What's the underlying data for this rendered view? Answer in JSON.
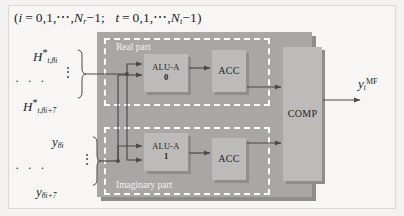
{
  "figure": {
    "domain_note": "hardware dataflow block diagram",
    "index_caption": {
      "full_text": "(i = 0,1,⋯, N_r −1;   t = 0,1,⋯, N_t −1)",
      "var_i": "i",
      "eq": "=",
      "seq_start": "0,1,",
      "ellipsis": "⋯",
      "bound_i_symbol": "N",
      "bound_i_sub": "r",
      "bound_i_tail": "−1;",
      "var_t": "t",
      "bound_t_symbol": "N",
      "bound_t_sub": "t",
      "bound_t_tail": "−1)",
      "open_paren": "(",
      "close_paren": ")"
    }
  },
  "inputs": {
    "h_first": {
      "base": "H",
      "star": "*",
      "sub": "t,8i"
    },
    "h_last": {
      "base": "H",
      "star": "*",
      "sub": "t,8i+7"
    },
    "y_first": {
      "base": "y",
      "sub": "8i"
    },
    "y_last": {
      "base": "y",
      "sub": "8i+7"
    },
    "horizontal_dots": "· · ·",
    "vertical_dots": "⋮"
  },
  "panels": [
    {
      "id": "real",
      "title": "Real part"
    },
    {
      "id": "imaginary",
      "title": "Imaginary part"
    }
  ],
  "units": {
    "alu0": {
      "label": "ALU-A",
      "index": "0"
    },
    "acc0": {
      "label": "ACC"
    },
    "alu1": {
      "label": "ALU-A",
      "index": "1"
    },
    "acc1": {
      "label": "ACC"
    },
    "comp": {
      "label": "COMP"
    }
  },
  "output": {
    "base": "y",
    "sub": "t",
    "sup": "MF"
  },
  "colors": {
    "background": "#f3f2f1",
    "main_panel": "#a9a7a5",
    "panel_shadow": "#8f8d8b",
    "unit_box": "#bdbbb9",
    "unit_shadow": "#908e8c",
    "dashed_border": "#fdfdfd",
    "wire": "#4a4a4a",
    "text": "#1f1f1f"
  }
}
